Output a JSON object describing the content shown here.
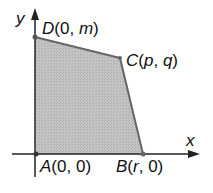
{
  "diagram": {
    "type": "coordinate-quadrilateral",
    "axes": {
      "x_label": "x",
      "y_label": "y"
    },
    "vertices": [
      {
        "name": "A",
        "coords": [
          "0",
          "0"
        ],
        "label_prefix": "A(",
        "label_x": "0",
        "label_sep": ", ",
        "label_y": "0",
        "label_suffix": ")"
      },
      {
        "name": "B",
        "coords": [
          "r",
          "0"
        ],
        "label_prefix": "B(",
        "label_x": "r",
        "label_sep": ", ",
        "label_y": "0",
        "label_suffix": ")"
      },
      {
        "name": "C",
        "coords": [
          "p",
          "q"
        ],
        "label_prefix": "C(",
        "label_x": "p",
        "label_sep": ", ",
        "label_y": "q",
        "label_suffix": ")"
      },
      {
        "name": "D",
        "coords": [
          "0",
          "m"
        ],
        "label_prefix": "D(",
        "label_x": "0",
        "label_sep": ", ",
        "label_y": "m",
        "label_suffix": ")"
      }
    ],
    "colors": {
      "fill": "#bdbdbd",
      "edge": "#666666",
      "axis": "#222222",
      "text": "#111111"
    }
  }
}
